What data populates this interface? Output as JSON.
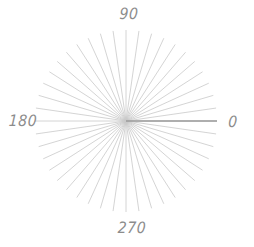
{
  "figure": {
    "width": 254,
    "height": 247,
    "background_color": "#ffffff"
  },
  "chart_data": {
    "type": "line",
    "subtype": "polar-spoke-diagram",
    "title": "",
    "subtitle": "",
    "xlabel": "",
    "ylabel": "",
    "grid": false,
    "legend": null,
    "center": {
      "x": 126,
      "y": 121
    },
    "radius": 91,
    "theta_unit": "degrees",
    "theta_direction": "counterclockwise",
    "theta_zero_location": "E",
    "rlim": [
      0,
      1
    ],
    "thetalim": [
      0,
      360
    ],
    "tick_labels": [
      {
        "name": "theta-0",
        "text": "0",
        "angle_deg": 0,
        "x": 233,
        "y": 121
      },
      {
        "name": "theta-90",
        "text": "90",
        "angle_deg": 90,
        "x": 129,
        "y": 13
      },
      {
        "name": "theta-180",
        "text": "180",
        "angle_deg": 180,
        "x": 23,
        "y": 120
      },
      {
        "name": "theta-270",
        "text": "270",
        "angle_deg": 270,
        "x": 132,
        "y": 227
      }
    ],
    "spokes": {
      "count": 44,
      "angle_step_deg": 8.1818,
      "angles_deg": [
        0,
        8.18,
        16.36,
        24.55,
        32.73,
        40.91,
        49.09,
        57.27,
        65.45,
        73.64,
        81.82,
        90,
        98.18,
        106.36,
        114.55,
        122.73,
        130.91,
        139.09,
        147.27,
        155.45,
        163.64,
        171.82,
        180,
        188.18,
        196.36,
        204.55,
        212.73,
        220.91,
        229.09,
        237.27,
        245.45,
        253.64,
        261.82,
        270,
        278.18,
        286.36,
        294.55,
        302.73,
        310.91,
        319.09,
        327.27,
        335.45,
        343.64,
        351.82
      ],
      "values": [
        1,
        1,
        1,
        1,
        1,
        1,
        1,
        1,
        1,
        1,
        1,
        1,
        1,
        1,
        1,
        1,
        1,
        1,
        1,
        1,
        1,
        1,
        1,
        1,
        1,
        1,
        1,
        1,
        1,
        1,
        1,
        1,
        1,
        1,
        1,
        1,
        1,
        1,
        1,
        1,
        1,
        1,
        1,
        1
      ],
      "color": "#c9c9c9",
      "width": 0.8
    },
    "highlighted_spoke": {
      "name": "zero-degree-axis",
      "angle_deg": 0,
      "value": 1,
      "color": "#9a9a9a",
      "width": 1.6
    },
    "colors": {
      "spoke": "#c9c9c9",
      "axis_highlight": "#9a9a9a",
      "label": "#8c8c8c",
      "background": "#ffffff"
    }
  }
}
